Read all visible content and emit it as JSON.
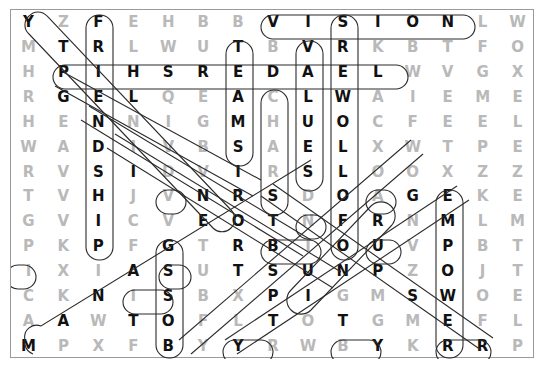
{
  "puzzle": {
    "type": "word-search",
    "columns": 15,
    "rows": 14,
    "grid": [
      [
        "Y",
        "Z",
        "F",
        "E",
        "H",
        "B",
        "B",
        "V",
        "I",
        "S",
        "I",
        "O",
        "N",
        "L",
        "W"
      ],
      [
        "M",
        "T",
        "R",
        "L",
        "W",
        "U",
        "T",
        "B",
        "V",
        "R",
        "K",
        "B",
        "T",
        "F",
        "O"
      ],
      [
        "H",
        "P",
        "I",
        "H",
        "S",
        "R",
        "E",
        "D",
        "A",
        "E",
        "L",
        "W",
        "V",
        "G",
        "X"
      ],
      [
        "R",
        "G",
        "E",
        "L",
        "Q",
        "E",
        "A",
        "C",
        "L",
        "W",
        "A",
        "I",
        "E",
        "M",
        "E"
      ],
      [
        "H",
        "E",
        "N",
        "N",
        "I",
        "G",
        "M",
        "H",
        "U",
        "O",
        "C",
        "F",
        "E",
        "E",
        "L"
      ],
      [
        "W",
        "A",
        "D",
        "I",
        "V",
        "B",
        "S",
        "A",
        "E",
        "L",
        "X",
        "W",
        "T",
        "P",
        "E"
      ],
      [
        "R",
        "V",
        "S",
        "I",
        "D",
        "V",
        "I",
        "R",
        "S",
        "L",
        "O",
        "O",
        "X",
        "Z",
        "Z"
      ],
      [
        "T",
        "V",
        "H",
        "J",
        "V",
        "N",
        "R",
        "S",
        "D",
        "O",
        "A",
        "G",
        "E",
        "K",
        "E"
      ],
      [
        "G",
        "V",
        "I",
        "C",
        "V",
        "E",
        "O",
        "T",
        "N",
        "F",
        "R",
        "N",
        "M",
        "L",
        "M"
      ],
      [
        "P",
        "K",
        "P",
        "F",
        "G",
        "T",
        "R",
        "B",
        "I",
        "O",
        "U",
        "V",
        "P",
        "B",
        "T"
      ],
      [
        "I",
        "X",
        "I",
        "A",
        "S",
        "U",
        "T",
        "S",
        "U",
        "N",
        "P",
        "Z",
        "O",
        "J",
        "T"
      ],
      [
        "C",
        "K",
        "N",
        "I",
        "S",
        "B",
        "X",
        "P",
        "I",
        "G",
        "M",
        "S",
        "W",
        "O",
        "E"
      ],
      [
        "A",
        "A",
        "W",
        "T",
        "O",
        "F",
        "L",
        "T",
        "O",
        "T",
        "G",
        "M",
        "E",
        "F",
        "L"
      ],
      [
        "M",
        "P",
        "X",
        "F",
        "B",
        "Y",
        "Y",
        "R",
        "W",
        "B",
        "Y",
        "K",
        "R",
        "R",
        "P"
      ]
    ],
    "highlighted_cells": [
      [
        0,
        0
      ],
      [
        0,
        2
      ],
      [
        0,
        7
      ],
      [
        0,
        8
      ],
      [
        0,
        9
      ],
      [
        0,
        10
      ],
      [
        0,
        11
      ],
      [
        0,
        12
      ],
      [
        1,
        1
      ],
      [
        1,
        2
      ],
      [
        1,
        6
      ],
      [
        1,
        8
      ],
      [
        1,
        9
      ],
      [
        2,
        1
      ],
      [
        2,
        2
      ],
      [
        2,
        3
      ],
      [
        2,
        4
      ],
      [
        2,
        5
      ],
      [
        2,
        6
      ],
      [
        2,
        7
      ],
      [
        2,
        8
      ],
      [
        2,
        9
      ],
      [
        2,
        10
      ],
      [
        3,
        1
      ],
      [
        3,
        2
      ],
      [
        3,
        3
      ],
      [
        3,
        6
      ],
      [
        3,
        8
      ],
      [
        3,
        9
      ],
      [
        4,
        2
      ],
      [
        4,
        6
      ],
      [
        4,
        8
      ],
      [
        4,
        9
      ],
      [
        5,
        2
      ],
      [
        5,
        6
      ],
      [
        5,
        8
      ],
      [
        5,
        9
      ],
      [
        6,
        2
      ],
      [
        6,
        3
      ],
      [
        6,
        6
      ],
      [
        6,
        8
      ],
      [
        6,
        9
      ],
      [
        7,
        2
      ],
      [
        7,
        5
      ],
      [
        7,
        6
      ],
      [
        7,
        7
      ],
      [
        7,
        9
      ],
      [
        7,
        11
      ],
      [
        7,
        12
      ],
      [
        8,
        2
      ],
      [
        8,
        5
      ],
      [
        8,
        6
      ],
      [
        8,
        7
      ],
      [
        8,
        9
      ],
      [
        8,
        10
      ],
      [
        8,
        12
      ],
      [
        9,
        2
      ],
      [
        9,
        4
      ],
      [
        9,
        6
      ],
      [
        9,
        7
      ],
      [
        9,
        9
      ],
      [
        9,
        10
      ],
      [
        9,
        12
      ],
      [
        10,
        3
      ],
      [
        10,
        4
      ],
      [
        10,
        6
      ],
      [
        10,
        7
      ],
      [
        10,
        8
      ],
      [
        10,
        9
      ],
      [
        10,
        10
      ],
      [
        10,
        12
      ],
      [
        11,
        2
      ],
      [
        11,
        4
      ],
      [
        11,
        7
      ],
      [
        11,
        8
      ],
      [
        11,
        11
      ],
      [
        11,
        12
      ],
      [
        12,
        1
      ],
      [
        12,
        3
      ],
      [
        12,
        4
      ],
      [
        12,
        7
      ],
      [
        12,
        9
      ],
      [
        12,
        12
      ],
      [
        13,
        0
      ],
      [
        13,
        4
      ],
      [
        13,
        6
      ],
      [
        13,
        10
      ],
      [
        13,
        12
      ],
      [
        13,
        13
      ]
    ],
    "found_words": [
      {
        "word": "VISION",
        "direction": "horizontal",
        "start": [
          0,
          7
        ],
        "end": [
          0,
          12
        ]
      },
      {
        "word": "LEADERSHIP",
        "direction": "horizontal-reversed",
        "start": [
          2,
          10
        ],
        "end": [
          2,
          1
        ]
      },
      {
        "word": "VALUES",
        "direction": "vertical",
        "start": [
          0,
          8
        ],
        "end": [
          5,
          8
        ]
      },
      {
        "word": "FOLLOWERS",
        "direction": "vertical-reversed",
        "start": [
          9,
          9
        ],
        "end": [
          0,
          9
        ]
      },
      {
        "word": "CLUES",
        "direction": "vertical",
        "start": [
          3,
          8
        ],
        "end": [
          7,
          8
        ]
      },
      {
        "word": "TRUST",
        "direction": "vertical",
        "start": [
          1,
          6
        ],
        "end": [
          5,
          6
        ]
      },
      {
        "word": "FRIENDSHIP",
        "direction": "vertical",
        "start": [
          0,
          2
        ],
        "end": [
          9,
          2
        ]
      },
      {
        "word": "EMPOWER",
        "direction": "vertical",
        "start": [
          7,
          12
        ],
        "end": [
          13,
          12
        ]
      },
      {
        "word": "GOALS",
        "direction": "diagonal",
        "start": [
          0,
          0
        ],
        "end": [
          13,
          0
        ]
      },
      {
        "word": "GROUP",
        "direction": "diagonal",
        "start": [
          8,
          10
        ],
        "end": [
          12,
          12
        ]
      },
      {
        "word": "BOSS",
        "direction": "vertical",
        "start": [
          10,
          4
        ],
        "end": [
          13,
          4
        ]
      },
      {
        "word": "TEAMS",
        "direction": "vertical",
        "start": [
          1,
          6
        ],
        "end": [
          5,
          6
        ]
      }
    ],
    "colors": {
      "letter_dim": "#b9b9b9",
      "letter_found": "#111111",
      "circle_stroke": "#2b2b2b",
      "frame_border": "#9a9a9a",
      "background": "#ffffff"
    }
  }
}
